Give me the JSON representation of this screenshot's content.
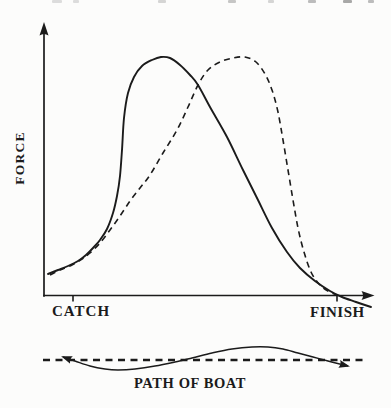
{
  "figure": {
    "ink_color": "#1b1b1b",
    "paper_color": "#fcfcfb"
  },
  "chart_data": {
    "type": "line",
    "title": "",
    "xlabel": "",
    "ylabel": "FORCE",
    "x_start_label": "CATCH",
    "x_end_label": "FINISH",
    "grid": false,
    "legend": false,
    "axis_style": "arrowed axes, no numeric scale (qualitative sketch)",
    "series": [
      {
        "name": "force curve A (solid, early peak)",
        "style": "solid",
        "dash": null,
        "points_px": [
          [
            48,
            274
          ],
          [
            58,
            270
          ],
          [
            68,
            266
          ],
          [
            78,
            261
          ],
          [
            86,
            255
          ],
          [
            93,
            248
          ],
          [
            100,
            240
          ],
          [
            107,
            229
          ],
          [
            113,
            213
          ],
          [
            117,
            196
          ],
          [
            120,
            176
          ],
          [
            122,
            150
          ],
          [
            124,
            118
          ],
          [
            128,
            93
          ],
          [
            134,
            77
          ],
          [
            142,
            66
          ],
          [
            152,
            60
          ],
          [
            161,
            57
          ],
          [
            170,
            58
          ],
          [
            180,
            65
          ],
          [
            190,
            75
          ],
          [
            198,
            85
          ],
          [
            210,
            107
          ],
          [
            227,
            137
          ],
          [
            243,
            170
          ],
          [
            258,
            200
          ],
          [
            272,
            228
          ],
          [
            287,
            252
          ],
          [
            300,
            268
          ],
          [
            315,
            281
          ],
          [
            330,
            291
          ],
          [
            342,
            297
          ],
          [
            356,
            302
          ],
          [
            371,
            307
          ]
        ]
      },
      {
        "name": "force curve B (dashed, late peak)",
        "style": "dashed",
        "dash": [
          6,
          4.5
        ],
        "points_px": [
          [
            50,
            275
          ],
          [
            60,
            270
          ],
          [
            72,
            265
          ],
          [
            82,
            259
          ],
          [
            90,
            253
          ],
          [
            100,
            243
          ],
          [
            110,
            230
          ],
          [
            120,
            216
          ],
          [
            130,
            201
          ],
          [
            140,
            188
          ],
          [
            150,
            175
          ],
          [
            163,
            153
          ],
          [
            177,
            130
          ],
          [
            188,
            107
          ],
          [
            198,
            85
          ],
          [
            208,
            70
          ],
          [
            220,
            62
          ],
          [
            233,
            58
          ],
          [
            245,
            57
          ],
          [
            256,
            62
          ],
          [
            265,
            74
          ],
          [
            272,
            90
          ],
          [
            278,
            112
          ],
          [
            283,
            140
          ],
          [
            288,
            170
          ],
          [
            293,
            200
          ],
          [
            298,
            228
          ],
          [
            304,
            252
          ],
          [
            311,
            272
          ],
          [
            319,
            284
          ],
          [
            328,
            291
          ],
          [
            337,
            295
          ]
        ]
      }
    ],
    "boat_path": {
      "label": "PATH OF BOAT",
      "baseline": {
        "style": "dashed",
        "dash": [
          7,
          5.5
        ],
        "x1": 43,
        "y": 360,
        "x2": 367
      },
      "arrows": "both ends",
      "points_px": [
        [
          63,
          357
        ],
        [
          75,
          361
        ],
        [
          90,
          366
        ],
        [
          105,
          369
        ],
        [
          118,
          370
        ],
        [
          135,
          369
        ],
        [
          155,
          366
        ],
        [
          175,
          362
        ],
        [
          192,
          358
        ],
        [
          212,
          353
        ],
        [
          232,
          349
        ],
        [
          252,
          347
        ],
        [
          268,
          347
        ],
        [
          283,
          349
        ],
        [
          298,
          353
        ],
        [
          313,
          357
        ],
        [
          328,
          361
        ],
        [
          340,
          364
        ],
        [
          348,
          366
        ]
      ]
    }
  }
}
